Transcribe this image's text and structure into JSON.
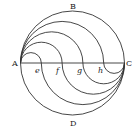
{
  "diagram": {
    "type": "geometric-figure",
    "labels": {
      "top": "B",
      "bottom": "D",
      "left": "A",
      "right": "C",
      "points": [
        "e",
        "f",
        "g",
        "h"
      ]
    },
    "colors": {
      "line": "#333333",
      "text": "#222222",
      "background": "#ffffff"
    }
  }
}
